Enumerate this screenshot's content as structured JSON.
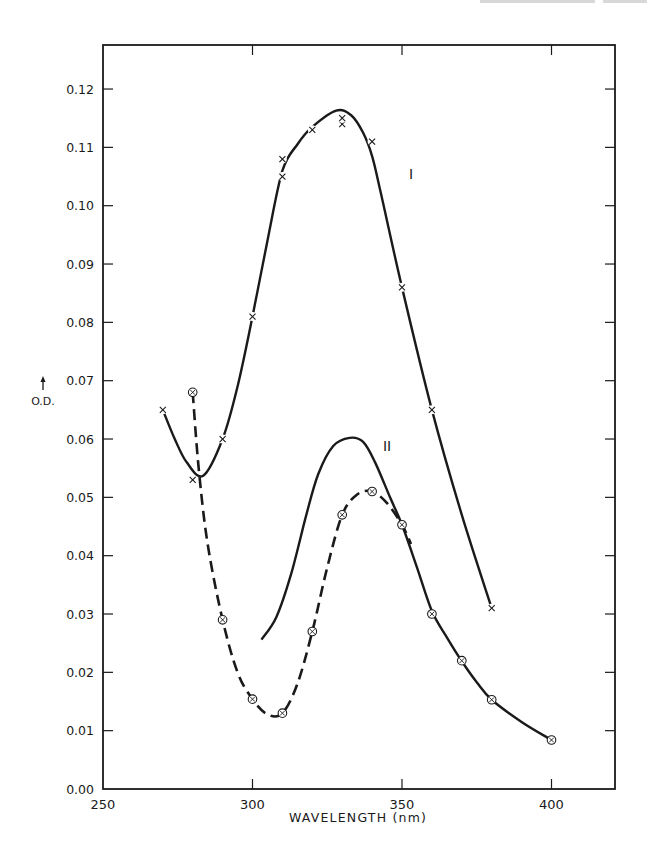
{
  "page": {
    "header_fragment_visible": true
  },
  "chart_data": {
    "type": "line",
    "title": "",
    "xlabel": "WAVELENGTH (nm)",
    "ylabel": "O.D.",
    "xlim": [
      250,
      420
    ],
    "ylim": [
      0.0,
      0.127
    ],
    "grid": false,
    "x_ticks": [
      250,
      300,
      350,
      400
    ],
    "x_tick_labels": [
      "250",
      "300",
      "350",
      "400"
    ],
    "y_ticks": [
      0.0,
      0.01,
      0.02,
      0.03,
      0.04,
      0.05,
      0.06,
      0.07,
      0.08,
      0.09,
      0.1,
      0.11,
      0.12
    ],
    "y_tick_labels": [
      "0.00",
      "0.01",
      "0.02",
      "0.03",
      "0.04",
      "0.05",
      "0.06",
      "0.07",
      "0.08",
      "0.09",
      "0.10",
      "0.11",
      "0.12"
    ],
    "series": [
      {
        "name": "I",
        "marker": "x",
        "line_style": "solid",
        "points": [
          {
            "x": 270,
            "y": 0.065
          },
          {
            "x": 280,
            "y": 0.053
          },
          {
            "x": 290,
            "y": 0.06
          },
          {
            "x": 300,
            "y": 0.081
          },
          {
            "x": 310,
            "y": 0.105
          },
          {
            "x": 310,
            "y": 0.108
          },
          {
            "x": 320,
            "y": 0.113
          },
          {
            "x": 330,
            "y": 0.114
          },
          {
            "x": 330,
            "y": 0.115
          },
          {
            "x": 340,
            "y": 0.111
          },
          {
            "x": 350,
            "y": 0.086
          },
          {
            "x": 360,
            "y": 0.065
          },
          {
            "x": 380,
            "y": 0.031
          }
        ],
        "curve": [
          [
            270,
            0.065
          ],
          [
            274,
            0.06
          ],
          [
            278,
            0.056
          ],
          [
            283.5,
            0.0537
          ],
          [
            290,
            0.06
          ],
          [
            295,
            0.069
          ],
          [
            300,
            0.081
          ],
          [
            305,
            0.094
          ],
          [
            310,
            0.106
          ],
          [
            315,
            0.1105
          ],
          [
            320,
            0.1135
          ],
          [
            328,
            0.1163
          ],
          [
            333,
            0.1155
          ],
          [
            337,
            0.1125
          ],
          [
            340,
            0.1085
          ],
          [
            343,
            0.102
          ],
          [
            350,
            0.086
          ],
          [
            360,
            0.065
          ],
          [
            370,
            0.047
          ],
          [
            380,
            0.031
          ]
        ],
        "label": {
          "text": "I",
          "x": 353,
          "y": 0.1045
        }
      },
      {
        "name": "II",
        "marker": "none",
        "line_style": "solid",
        "points": [],
        "curve": [
          [
            303,
            0.0256
          ],
          [
            308,
            0.0295
          ],
          [
            313,
            0.037
          ],
          [
            318,
            0.047
          ],
          [
            322,
            0.054
          ],
          [
            327,
            0.0588
          ],
          [
            332.5,
            0.0602
          ],
          [
            337,
            0.0595
          ],
          [
            341,
            0.056
          ],
          [
            346,
            0.05
          ],
          [
            350,
            0.0453
          ],
          [
            355,
            0.038
          ],
          [
            360,
            0.0305
          ],
          [
            365,
            0.026
          ],
          [
            370,
            0.0219
          ],
          [
            375,
            0.0183
          ],
          [
            380,
            0.0153
          ],
          [
            390,
            0.0115
          ],
          [
            400,
            0.0084
          ]
        ],
        "label": {
          "text": "II",
          "x": 345,
          "y": 0.058
        }
      },
      {
        "name": "II (dashed)",
        "marker": "circle-x",
        "line_style": "dashed",
        "points": [
          {
            "x": 280,
            "y": 0.068
          },
          {
            "x": 290,
            "y": 0.029
          },
          {
            "x": 300,
            "y": 0.0154
          },
          {
            "x": 310,
            "y": 0.013
          },
          {
            "x": 320,
            "y": 0.027
          },
          {
            "x": 330,
            "y": 0.047
          },
          {
            "x": 340,
            "y": 0.051
          },
          {
            "x": 350,
            "y": 0.0453
          },
          {
            "x": 360,
            "y": 0.03
          },
          {
            "x": 370,
            "y": 0.022
          },
          {
            "x": 380,
            "y": 0.0153
          },
          {
            "x": 400,
            "y": 0.0084
          }
        ],
        "curve": [
          [
            280,
            0.068
          ],
          [
            282,
            0.055
          ],
          [
            285,
            0.042
          ],
          [
            290,
            0.029
          ],
          [
            295,
            0.02
          ],
          [
            300,
            0.0154
          ],
          [
            305,
            0.0128
          ],
          [
            310,
            0.013
          ],
          [
            315,
            0.018
          ],
          [
            320,
            0.027
          ],
          [
            325,
            0.038
          ],
          [
            330,
            0.047
          ],
          [
            335,
            0.0505
          ],
          [
            340,
            0.051
          ],
          [
            345,
            0.049
          ],
          [
            350,
            0.0453
          ],
          [
            353,
            0.042
          ]
        ],
        "label": null
      }
    ],
    "legend": null,
    "annotations": [
      {
        "text": "I",
        "near_series": "I"
      },
      {
        "text": "II",
        "near_series": "II"
      }
    ]
  }
}
